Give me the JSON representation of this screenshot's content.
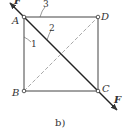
{
  "figure": {
    "caption": "b)",
    "nodes": [
      {
        "id": "A",
        "label": "A"
      },
      {
        "id": "B",
        "label": "B"
      },
      {
        "id": "C",
        "label": "C"
      },
      {
        "id": "D",
        "label": "D"
      }
    ],
    "members": [
      {
        "label": "1",
        "between": "A-B"
      },
      {
        "label": "2",
        "between": "A-C"
      },
      {
        "label": "3",
        "between": "A-D"
      }
    ],
    "forces": [
      {
        "label": "F",
        "at": "A"
      },
      {
        "label": "F",
        "at": "C"
      }
    ],
    "colors": {
      "line": "#333333",
      "dashed": "#aaaaaa",
      "background": "#ffffff"
    }
  }
}
